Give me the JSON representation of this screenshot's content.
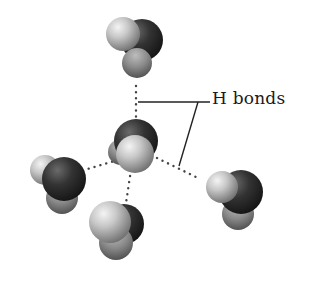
{
  "figure": {
    "label": "H bonds",
    "colors": {
      "background": "#ffffff",
      "oxygen_dark": "#2a2a2a",
      "oxygen_mid": "#555555",
      "hydrogen_light": "#e6e6e6",
      "hydrogen_mid": "#9a9a9a",
      "hydrogen_lower": "#7a7a7a",
      "bond_dots": "#444444",
      "leader_line": "#222222",
      "label_text": "#1a1a1a"
    },
    "molecules": [
      {
        "name": "top",
        "oxygen": [
          142,
          40,
          21
        ],
        "hydrogens": [
          [
            123,
            34,
            17
          ],
          [
            137,
            62,
            15
          ]
        ]
      },
      {
        "name": "center",
        "oxygen": [
          136,
          141,
          22
        ],
        "hydrogens": [
          [
            120,
            152,
            13
          ],
          [
            134,
            154,
            20
          ]
        ]
      },
      {
        "name": "left",
        "oxygen": [
          64,
          178,
          22
        ],
        "hydrogens": [
          [
            45,
            170,
            15
          ],
          [
            62,
            198,
            16
          ]
        ]
      },
      {
        "name": "bottom",
        "oxygen": [
          124,
          224,
          20
        ],
        "hydrogens": [
          [
            110,
            222,
            21
          ],
          [
            116,
            243,
            17
          ]
        ]
      },
      {
        "name": "right",
        "oxygen": [
          240,
          192,
          22
        ],
        "hydrogens": [
          [
            222,
            187,
            16
          ],
          [
            238,
            214,
            16
          ]
        ]
      }
    ],
    "hydrogen_bonds": [
      {
        "from": [
          136,
          86
        ],
        "to": [
          136,
          124
        ]
      },
      {
        "from": [
          118,
          160
        ],
        "to": [
          84,
          170
        ]
      },
      {
        "from": [
          131,
          170
        ],
        "to": [
          126,
          203
        ]
      },
      {
        "from": [
          157,
          158
        ],
        "to": [
          198,
          178
        ]
      }
    ],
    "leader_lines": [
      {
        "from": [
          138,
          102
        ],
        "to": [
          210,
          102
        ]
      },
      {
        "from": [
          198,
          102
        ],
        "to": [
          179,
          166
        ]
      }
    ]
  }
}
